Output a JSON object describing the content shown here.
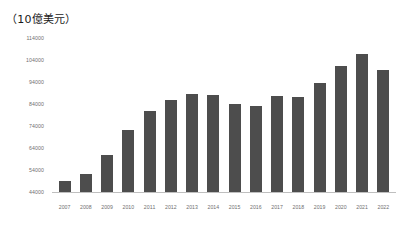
{
  "chart_data": {
    "type": "bar",
    "title": "（10億美元）",
    "xlabel": "",
    "ylabel": "",
    "ylim": [
      44000,
      114000
    ],
    "ytick_step": 10000,
    "ytick_labels": [
      "114000",
      "104000",
      "94000",
      "84000",
      "74000",
      "64000",
      "54000",
      "44000"
    ],
    "ytick_values": [
      114000,
      104000,
      94000,
      84000,
      74000,
      64000,
      54000,
      44000
    ],
    "grid": false,
    "legend": false,
    "bar_color": "#4d4d4d",
    "axis_color": "#bfbfbf",
    "tick_label_color": "#6f6f6f",
    "categories": [
      "2007",
      "2008",
      "2009",
      "2010",
      "2011",
      "2012",
      "2013",
      "2014",
      "2015",
      "2016",
      "2017",
      "2018",
      "2019",
      "2020",
      "2021",
      "2022"
    ],
    "values": [
      49000,
      52000,
      61000,
      72000,
      81000,
      86000,
      88500,
      88200,
      84000,
      83000,
      87600,
      87000,
      93500,
      101500,
      106800,
      99500
    ]
  }
}
